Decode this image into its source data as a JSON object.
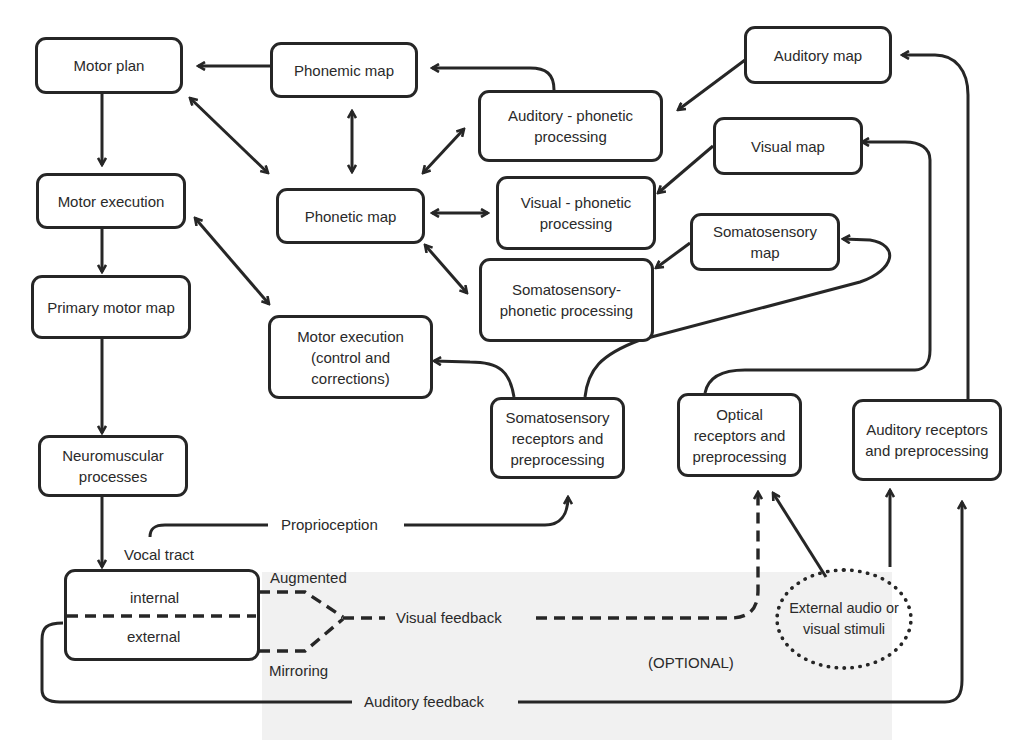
{
  "diagram": {
    "type": "flowchart",
    "nodes": {
      "motor_plan": "Motor plan",
      "phonemic_map": "Phonemic map",
      "auditory_map": "Auditory map",
      "auditory_phonetic": "Auditory - phonetic processing",
      "visual_map": "Visual map",
      "motor_execution": "Motor execution",
      "phonetic_map": "Phonetic map",
      "visual_phonetic": "Visual - phonetic processing",
      "somatosensory_map": "Somatosensory map",
      "primary_motor_map": "Primary motor map",
      "somatosensory_phonetic": "Somatosensory- phonetic processing",
      "motor_execution_control": "Motor execution (control and corrections)",
      "neuromuscular": "Neuromuscular processes",
      "somatosensory_receptors": "Somatosensory receptors and preprocessing",
      "optical_receptors": "Optical receptors and preprocessing",
      "auditory_receptors": "Auditory receptors and preprocessing",
      "vocal_tract_internal": "internal",
      "vocal_tract_external": "external",
      "external_stimuli": "External audio or visual stimuli"
    },
    "labels": {
      "vocal_tract": "Vocal tract",
      "proprioception": "Proprioception",
      "augmented": "Augmented",
      "mirroring": "Mirroring",
      "visual_feedback": "Visual feedback",
      "optional": "(OPTIONAL)",
      "auditory_feedback": "Auditory feedback"
    },
    "edges": [
      {
        "from": "phonemic_map",
        "to": "motor_plan",
        "style": "solid"
      },
      {
        "from": "auditory_phonetic",
        "to": "phonemic_map",
        "style": "solid"
      },
      {
        "from": "auditory_map",
        "to": "auditory_phonetic",
        "style": "solid"
      },
      {
        "from": "motor_plan",
        "to": "phonetic_map",
        "style": "solid",
        "bidirectional": true
      },
      {
        "from": "phonemic_map",
        "to": "phonetic_map",
        "style": "solid",
        "bidirectional": true
      },
      {
        "from": "phonetic_map",
        "to": "auditory_phonetic",
        "style": "solid",
        "bidirectional": true
      },
      {
        "from": "phonetic_map",
        "to": "visual_phonetic",
        "style": "solid",
        "bidirectional": true
      },
      {
        "from": "phonetic_map",
        "to": "somatosensory_phonetic",
        "style": "solid",
        "bidirectional": true
      },
      {
        "from": "visual_map",
        "to": "visual_phonetic",
        "style": "solid"
      },
      {
        "from": "somatosensory_map",
        "to": "somatosensory_phonetic",
        "style": "solid"
      },
      {
        "from": "motor_plan",
        "to": "motor_execution",
        "style": "solid"
      },
      {
        "from": "motor_execution",
        "to": "primary_motor_map",
        "style": "solid"
      },
      {
        "from": "motor_execution",
        "to": "motor_execution_control",
        "style": "solid",
        "bidirectional": true
      },
      {
        "from": "primary_motor_map",
        "to": "neuromuscular",
        "style": "solid"
      },
      {
        "from": "neuromuscular",
        "to": "vocal_tract",
        "style": "solid"
      },
      {
        "from": "somatosensory_receptors",
        "to": "motor_execution_control",
        "style": "solid"
      },
      {
        "from": "somatosensory_receptors",
        "to": "somatosensory_map",
        "style": "solid"
      },
      {
        "from": "optical_receptors",
        "to": "visual_map",
        "style": "solid"
      },
      {
        "from": "auditory_receptors",
        "to": "auditory_map",
        "style": "solid"
      },
      {
        "from": "vocal_tract",
        "to": "somatosensory_receptors",
        "style": "solid",
        "label": "Proprioception"
      },
      {
        "from": "vocal_tract",
        "to": "optical_receptors",
        "style": "dashed",
        "label": "Visual feedback"
      },
      {
        "from": "vocal_tract",
        "to": "auditory_receptors",
        "style": "solid",
        "label": "Auditory feedback"
      },
      {
        "from": "external_stimuli",
        "to": "optical_receptors",
        "style": "solid"
      },
      {
        "from": "external_stimuli",
        "to": "auditory_receptors",
        "style": "solid"
      }
    ]
  }
}
